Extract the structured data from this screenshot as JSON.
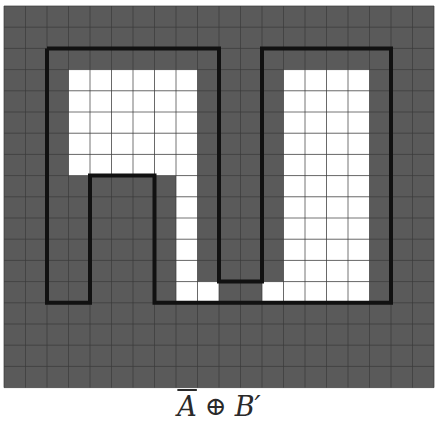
{
  "figure": {
    "grid": {
      "cols": 20,
      "rows": 18,
      "origin_x": 4,
      "origin_y": 6,
      "cell_w": 21.5,
      "cell_h": 21.2,
      "background_color": "#5a5a5a",
      "foreground_color": "#ffffff",
      "gridline_color": "#3a3a3a",
      "outline_color": "#111111"
    },
    "white_cells": [
      [
        3,
        3
      ],
      [
        4,
        3
      ],
      [
        5,
        3
      ],
      [
        6,
        3
      ],
      [
        7,
        3
      ],
      [
        8,
        3
      ],
      [
        3,
        4
      ],
      [
        4,
        4
      ],
      [
        5,
        4
      ],
      [
        6,
        4
      ],
      [
        7,
        4
      ],
      [
        8,
        4
      ],
      [
        3,
        5
      ],
      [
        4,
        5
      ],
      [
        5,
        5
      ],
      [
        6,
        5
      ],
      [
        7,
        5
      ],
      [
        8,
        5
      ],
      [
        3,
        6
      ],
      [
        4,
        6
      ],
      [
        5,
        6
      ],
      [
        6,
        6
      ],
      [
        7,
        6
      ],
      [
        8,
        6
      ],
      [
        3,
        7
      ],
      [
        4,
        7
      ],
      [
        5,
        7
      ],
      [
        6,
        7
      ],
      [
        7,
        7
      ],
      [
        8,
        7
      ],
      [
        8,
        8
      ],
      [
        8,
        9
      ],
      [
        8,
        10
      ],
      [
        8,
        11
      ],
      [
        8,
        12
      ],
      [
        8,
        13
      ],
      [
        9,
        13
      ],
      [
        12,
        13
      ],
      [
        13,
        3
      ],
      [
        14,
        3
      ],
      [
        15,
        3
      ],
      [
        16,
        3
      ],
      [
        13,
        4
      ],
      [
        14,
        4
      ],
      [
        15,
        4
      ],
      [
        16,
        4
      ],
      [
        13,
        5
      ],
      [
        14,
        5
      ],
      [
        15,
        5
      ],
      [
        16,
        5
      ],
      [
        13,
        6
      ],
      [
        14,
        6
      ],
      [
        15,
        6
      ],
      [
        16,
        6
      ],
      [
        13,
        7
      ],
      [
        14,
        7
      ],
      [
        15,
        7
      ],
      [
        16,
        7
      ],
      [
        13,
        8
      ],
      [
        14,
        8
      ],
      [
        15,
        8
      ],
      [
        16,
        8
      ],
      [
        13,
        9
      ],
      [
        14,
        9
      ],
      [
        15,
        9
      ],
      [
        16,
        9
      ],
      [
        13,
        10
      ],
      [
        14,
        10
      ],
      [
        15,
        10
      ],
      [
        16,
        10
      ],
      [
        13,
        11
      ],
      [
        14,
        11
      ],
      [
        15,
        11
      ],
      [
        16,
        11
      ],
      [
        13,
        12
      ],
      [
        14,
        12
      ],
      [
        15,
        12
      ],
      [
        16,
        12
      ],
      [
        13,
        13
      ],
      [
        14,
        13
      ],
      [
        15,
        13
      ],
      [
        16,
        13
      ]
    ],
    "outline_path_cells": [
      [
        2,
        2
      ],
      [
        10,
        2
      ],
      [
        10,
        13
      ],
      [
        12,
        13
      ],
      [
        12,
        2
      ],
      [
        18,
        2
      ],
      [
        18,
        14
      ],
      [
        7,
        14
      ],
      [
        7,
        8
      ],
      [
        4,
        8
      ],
      [
        4,
        14
      ],
      [
        2,
        14
      ],
      [
        2,
        2
      ]
    ]
  },
  "caption": {
    "a_bar": "A",
    "operator": "⊕",
    "b_prime": "B′"
  }
}
